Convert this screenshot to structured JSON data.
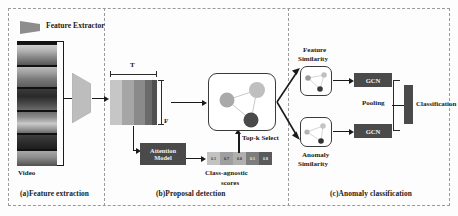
{
  "figure": {
    "panels": [
      {
        "id": "a",
        "caption": "(a)Feature extraction"
      },
      {
        "id": "b",
        "caption": "(b)Proposal detection"
      },
      {
        "id": "c",
        "caption": "(c)Anomaly classification"
      }
    ]
  },
  "legend": {
    "extractor_label": "Feature Extractor"
  },
  "panel_a": {
    "video_label": "Video",
    "frame_count": 6
  },
  "panel_b": {
    "feature_map": {
      "axis_top_label": "T",
      "axis_right_label": "F"
    },
    "attention_model": {
      "line1": "Attention",
      "line2": "Model"
    },
    "topk_label": "Top-k Select",
    "scores_caption_line1": "Class-agnostic",
    "scores_caption_line2": "scores",
    "scores": [
      "0.1",
      "0.7",
      "0.6",
      "0.1",
      "0.8"
    ],
    "score_values": [
      0.1,
      0.7,
      0.6,
      0.1,
      0.8
    ]
  },
  "panel_c": {
    "feature_similarity_line1": "Feature",
    "feature_similarity_line2": "Similarity",
    "anomaly_similarity_line1": "Anomaly",
    "anomaly_similarity_line2": "Similarity",
    "gcn_top_label": "GCN",
    "gcn_bottom_label": "GCN",
    "pooling_label": "Pooling",
    "classification_label": "Classification"
  },
  "colors": {
    "dark_box": "#4a4a4a",
    "panel_border": "#9a9a9a",
    "arrow": "#1a1a1a",
    "node_light": "#b0b0b0",
    "node_mid": "#9a9a9a",
    "node_dark": "#4a4a4a",
    "background": "#fdfdfd"
  }
}
